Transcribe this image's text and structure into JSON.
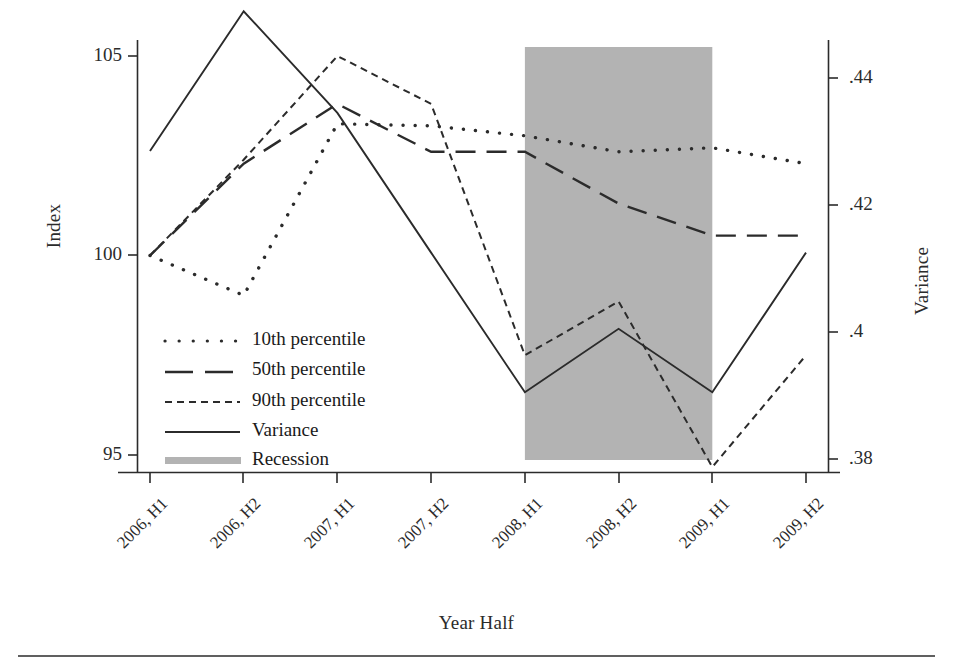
{
  "chart_data": {
    "type": "line",
    "title": "",
    "xlabel": "Year Half",
    "ylabel": "Index",
    "y2label": "Variance",
    "categories": [
      "2006, H1",
      "2006, H2",
      "2007, H1",
      "2007, H2",
      "2008, H1",
      "2008, H2",
      "2009, H1",
      "2009, H2"
    ],
    "ylim": [
      93.75,
      106.25
    ],
    "yticks": [
      95,
      100,
      105
    ],
    "ytick_labels": [
      "95",
      "100",
      "105"
    ],
    "y2lim": [
      0.3715,
      0.4515
    ],
    "y2ticks": [
      0.38,
      0.4,
      0.42,
      0.44
    ],
    "y2tick_labels": [
      ".38",
      ".4",
      ".42",
      ".44"
    ],
    "grid": false,
    "legend_position": "inside-lower-left",
    "series": [
      {
        "name": "10th percentile",
        "axis": "left",
        "style": "dotted",
        "values": [
          100.0,
          99.0,
          103.3,
          103.25,
          103.0,
          102.6,
          102.7,
          102.3
        ]
      },
      {
        "name": "50th percentile",
        "axis": "left",
        "style": "long-dash",
        "values": [
          100.0,
          102.3,
          103.8,
          102.6,
          102.6,
          101.3,
          100.5,
          100.5
        ]
      },
      {
        "name": "90th percentile",
        "axis": "left",
        "style": "short-dash",
        "values": [
          100.0,
          102.4,
          105.0,
          103.8,
          97.5,
          98.85,
          94.7,
          97.5
        ]
      },
      {
        "name": "Variance",
        "axis": "right",
        "style": "solid",
        "values": [
          0.4285,
          0.4505,
          0.4345,
          0.4125,
          0.3905,
          0.4005,
          0.3905,
          0.4125
        ]
      }
    ],
    "shaded_region": {
      "name": "Recession",
      "from": "2008, H1",
      "to": "2009, H1",
      "color": "#b3b3b3"
    }
  },
  "legend": {
    "items": [
      {
        "label": "10th percentile",
        "style": "dotted"
      },
      {
        "label": "50th percentile",
        "style": "long-dash"
      },
      {
        "label": "90th percentile",
        "style": "short-dash"
      },
      {
        "label": "Variance",
        "style": "solid"
      },
      {
        "label": "Recession",
        "style": "band"
      }
    ]
  },
  "colors": {
    "line": "#2b2b2b",
    "recession_band": "#b3b3b3",
    "axis": "#2b2b2b",
    "background": "#ffffff"
  }
}
